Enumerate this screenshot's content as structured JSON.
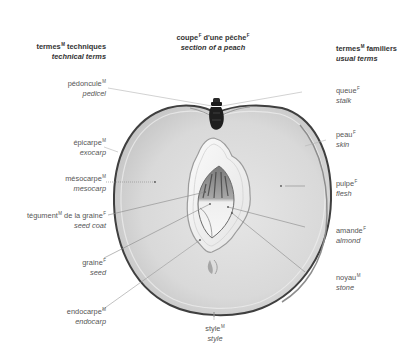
{
  "title": {
    "fr": "coupe",
    "fr_sup": "F",
    "fr_rest": " d'une pêche",
    "fr_rest_sup": "F",
    "en": "section of a peach"
  },
  "column_headers": {
    "left": {
      "fr": "termes",
      "fr_sup": "M",
      "fr_rest": " techniques",
      "en": "technical terms"
    },
    "right": {
      "fr": "termes",
      "fr_sup": "M",
      "fr_rest": " familiers",
      "en": "usual terms"
    }
  },
  "labels": {
    "pedoncule": {
      "fr": "pédoncule",
      "gender": "M",
      "en": "pedicel"
    },
    "epicarpe": {
      "fr": "épicarpe",
      "gender": "M",
      "en": "exocarp"
    },
    "mesocarpe": {
      "fr": "mésocarpe",
      "gender": "M",
      "en": "mesocarp"
    },
    "tegument": {
      "fr": "tégument",
      "gender": "M",
      "fr_rest": " de la graine",
      "gender2": "F",
      "en": "seed coat"
    },
    "graine": {
      "fr": "graine",
      "gender": "F",
      "en": "seed"
    },
    "endocarpe": {
      "fr": "endocarpe",
      "gender": "M",
      "en": "endocarp"
    },
    "style": {
      "fr": "style",
      "gender": "M",
      "en": "style"
    },
    "queue": {
      "fr": "queue",
      "gender": "F",
      "en": "stalk"
    },
    "peau": {
      "fr": "peau",
      "gender": "F",
      "en": "skin"
    },
    "pulpe": {
      "fr": "pulpe",
      "gender": "F",
      "en": "flesh"
    },
    "amande": {
      "fr": "amande",
      "gender": "F",
      "en": "almond"
    },
    "noyau": {
      "fr": "noyau",
      "gender": "M",
      "en": "stone"
    }
  },
  "colors": {
    "text": "#555555",
    "heading": "#333333",
    "leader_line": "#aaaaaa",
    "skin_edge": "#4a4a4a",
    "flesh": "#d8d8d8",
    "stone": "#f2f2f2",
    "stalk": "#1e1e1e"
  }
}
